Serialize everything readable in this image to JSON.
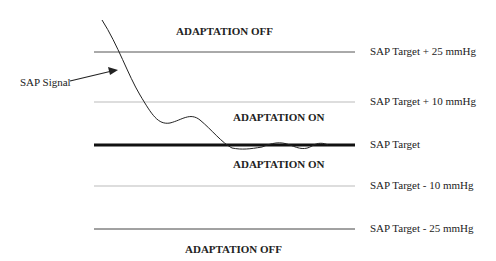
{
  "diagram": {
    "signal_label": "SAP Signal",
    "zones": {
      "upper_off": "ADAPTATION OFF",
      "upper_on": "ADAPTATION ON",
      "lower_on": "ADAPTATION ON",
      "lower_off": "ADAPTATION OFF"
    },
    "thresholds": [
      {
        "label": "SAP Target + 25 mmHg",
        "y": 52,
        "style": "thin-dark"
      },
      {
        "label": "SAP Target + 10 mmHg",
        "y": 102,
        "style": "thin-light"
      },
      {
        "label": "SAP Target",
        "y": 145,
        "style": "thick"
      },
      {
        "label": "SAP Target - 10 mmHg",
        "y": 186,
        "style": "thin-light"
      },
      {
        "label": "SAP Target - 25 mmHg",
        "y": 229,
        "style": "thin-dark"
      }
    ]
  }
}
